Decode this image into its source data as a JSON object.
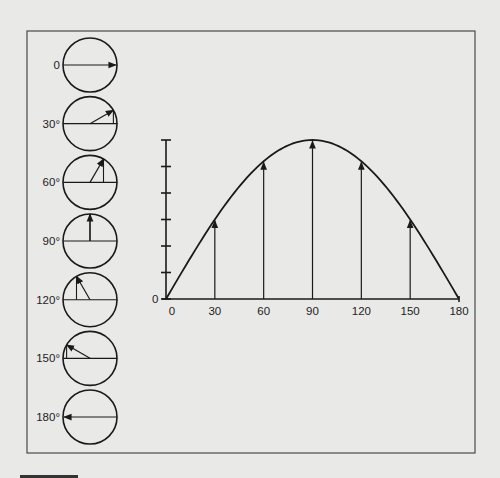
{
  "figure": {
    "colors": {
      "background": "#e9e9e8",
      "frame": "#4a4a4a",
      "ink": "#1a1a1a"
    },
    "phasor_circles": [
      {
        "angle": 0,
        "label": "0"
      },
      {
        "angle": 30,
        "label": "30°"
      },
      {
        "angle": 60,
        "label": "60°"
      },
      {
        "angle": 90,
        "label": "90°"
      },
      {
        "angle": 120,
        "label": "120°"
      },
      {
        "angle": 150,
        "label": "150°"
      },
      {
        "angle": 180,
        "label": "180°"
      }
    ],
    "graph": {
      "y_origin_label": "0",
      "x_tick_labels": [
        "0",
        "30",
        "60",
        "90",
        "120",
        "150",
        "180"
      ],
      "y_tick_count": 6
    }
  },
  "chart_data": {
    "type": "line",
    "title": "",
    "xlabel": "",
    "ylabel": "",
    "x": [
      0,
      30,
      60,
      90,
      120,
      150,
      180
    ],
    "series": [
      {
        "name": "sine curve (vertical component of rotating vector)",
        "values": [
          0,
          0.5,
          0.866,
          1.0,
          0.866,
          0.5,
          0
        ]
      }
    ],
    "vertical_arrows_at": [
      30,
      60,
      90,
      120,
      150
    ],
    "xlim": [
      0,
      180
    ],
    "ylim": [
      0,
      1
    ],
    "y_ticks_unlabeled": 6,
    "grid": false,
    "legend": "none"
  }
}
